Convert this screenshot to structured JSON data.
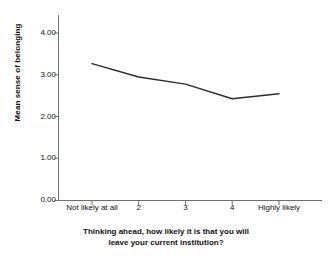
{
  "chart_data": {
    "type": "line",
    "title": "",
    "subtitle": "",
    "xlabel_line1": "Thinking ahead, how likely it is that you will",
    "xlabel_line2": "leave your current institution?",
    "ylabel": "Mean sense of belonging",
    "categories": [
      "Not likely at all",
      "2",
      "3",
      "4",
      "Highly likely"
    ],
    "values": [
      3.27,
      2.95,
      2.78,
      2.43,
      2.55
    ],
    "ylim": [
      0.0,
      4.0
    ],
    "ytick_labels": [
      "0.00",
      "1.00",
      "2.00",
      "3.00",
      "4.00"
    ],
    "ytick_values": [
      0.0,
      1.0,
      2.0,
      3.0,
      4.0
    ],
    "grid": false,
    "legend": "none",
    "line_color": "#2b2b2b",
    "axis_color": "#6f6f6f",
    "background_color": "#ffffff"
  }
}
